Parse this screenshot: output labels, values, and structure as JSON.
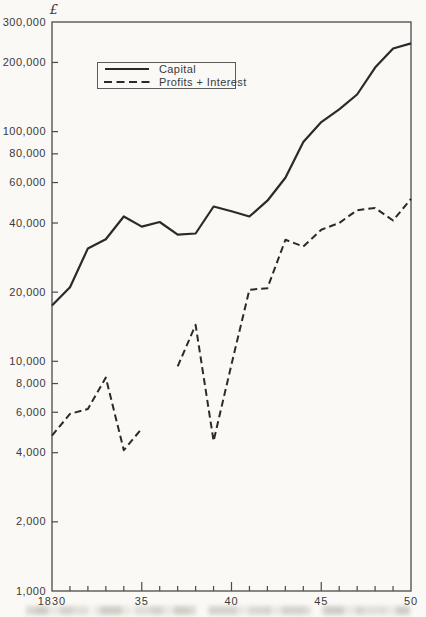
{
  "figure": {
    "currency_symbol": "£",
    "paper_color": "#faf9f5",
    "ink_color": "#2a2a2a",
    "axis_color": "#4a4a4a",
    "label_color": "#3a3a3a"
  },
  "chart_data": {
    "type": "line",
    "title": "",
    "xlabel": "",
    "ylabel": "£",
    "y_scale": "log",
    "ylim": [
      1000,
      300000
    ],
    "xlim": [
      1830,
      1850
    ],
    "grid": false,
    "legend_position": "top-left-inside",
    "x": [
      1830,
      1831,
      1832,
      1833,
      1834,
      1835,
      1836,
      1837,
      1838,
      1839,
      1840,
      1841,
      1842,
      1843,
      1844,
      1845,
      1846,
      1847,
      1848,
      1849,
      1850
    ],
    "x_ticks": [
      {
        "value": 1830,
        "label": "1830"
      },
      {
        "value": 1835,
        "label": "35"
      },
      {
        "value": 1840,
        "label": "40"
      },
      {
        "value": 1845,
        "label": "45"
      },
      {
        "value": 1850,
        "label": "50"
      }
    ],
    "x_minor_tick_step_years": 1,
    "y_ticks": [
      {
        "value": 300000,
        "label": "300,000"
      },
      {
        "value": 200000,
        "label": "200,000"
      },
      {
        "value": 100000,
        "label": "100,000"
      },
      {
        "value": 80000,
        "label": "80,000"
      },
      {
        "value": 60000,
        "label": "60,000"
      },
      {
        "value": 40000,
        "label": "40,000"
      },
      {
        "value": 20000,
        "label": "20,000"
      },
      {
        "value": 10000,
        "label": "10,000"
      },
      {
        "value": 8000,
        "label": "8,000"
      },
      {
        "value": 6000,
        "label": "6,000"
      },
      {
        "value": 4000,
        "label": "4,000"
      },
      {
        "value": 2000,
        "label": "2,000"
      },
      {
        "value": 1000,
        "label": "1,000"
      }
    ],
    "series": [
      {
        "name": "Capital",
        "line_style": "solid",
        "values": [
          17500,
          21000,
          31000,
          34000,
          42700,
          38600,
          40400,
          35600,
          36000,
          47200,
          45000,
          42700,
          50000,
          63000,
          90000,
          110000,
          125000,
          145000,
          190000,
          230000,
          242000
        ]
      },
      {
        "name": "Profits + Interest",
        "line_style": "dashed",
        "values": [
          4750,
          5900,
          6200,
          8500,
          4100,
          5100,
          null,
          9500,
          14400,
          4500,
          9700,
          20500,
          20800,
          33800,
          31600,
          37400,
          40000,
          45500,
          46500,
          41000,
          51000
        ]
      }
    ]
  }
}
